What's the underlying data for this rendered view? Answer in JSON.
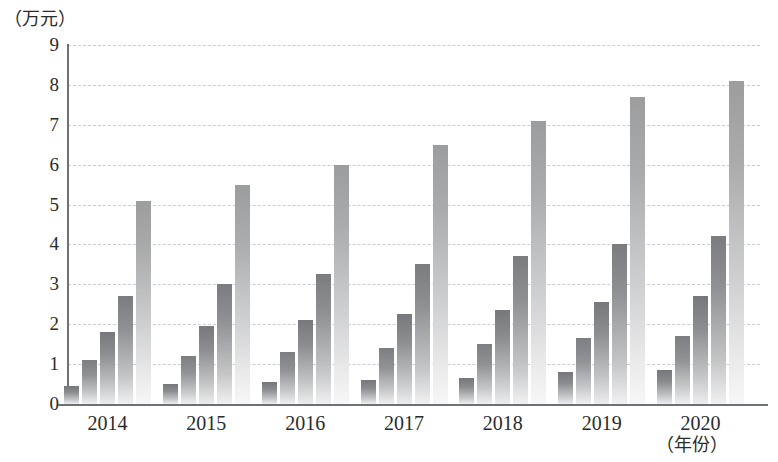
{
  "chart_data": {
    "type": "bar",
    "title": "",
    "subtitle": "",
    "xlabel": "（年份）",
    "ylabel": "（万元）",
    "ylim": [
      0,
      9
    ],
    "yticks": [
      0,
      1,
      2,
      3,
      4,
      5,
      6,
      7,
      8,
      9
    ],
    "ytick_labels": [
      "0",
      "1",
      "2",
      "3",
      "4",
      "5",
      "6",
      "7",
      "8",
      "9"
    ],
    "grid": true,
    "legend": "none",
    "categories": [
      "2014",
      "2015",
      "2016",
      "2017",
      "2018",
      "2019",
      "2020"
    ],
    "series": [
      {
        "name": "series-1",
        "values": [
          0.45,
          0.5,
          0.55,
          0.6,
          0.65,
          0.8,
          0.85
        ]
      },
      {
        "name": "series-2",
        "values": [
          1.1,
          1.2,
          1.3,
          1.4,
          1.5,
          1.65,
          1.7
        ]
      },
      {
        "name": "series-3",
        "values": [
          1.8,
          1.95,
          2.1,
          2.25,
          2.35,
          2.55,
          2.7
        ]
      },
      {
        "name": "series-4",
        "values": [
          2.7,
          3.0,
          3.25,
          3.5,
          3.7,
          4.0,
          4.2
        ]
      },
      {
        "name": "series-5",
        "values": [
          5.1,
          5.5,
          6.0,
          6.5,
          7.1,
          7.7,
          8.1
        ]
      }
    ],
    "colors": {
      "bar_top": "#808285",
      "bar_bottom": "#f5f5f6",
      "gridline": "#c9ccd4",
      "axis": "#6e7277",
      "text": "#2b2b2b"
    }
  }
}
